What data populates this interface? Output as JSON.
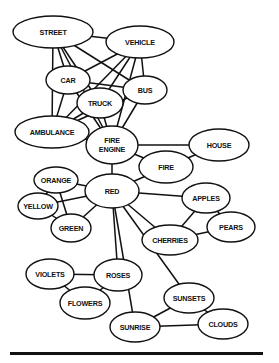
{
  "diagram": {
    "type": "semantic-network",
    "colors": {
      "line": "#111111",
      "node_fill": "#ffffff",
      "background": "#ffffff"
    },
    "nodes": [
      {
        "id": "street",
        "lines": [
          "STREET"
        ],
        "cx": 53,
        "cy": 32,
        "rx": 40,
        "ry": 16
      },
      {
        "id": "vehicle",
        "lines": [
          "VEHICLE"
        ],
        "cx": 140,
        "cy": 42,
        "rx": 34,
        "ry": 16
      },
      {
        "id": "car",
        "lines": [
          "CAR"
        ],
        "cx": 68,
        "cy": 80,
        "rx": 22,
        "ry": 14
      },
      {
        "id": "truck",
        "lines": [
          "TRUCK"
        ],
        "cx": 100,
        "cy": 103,
        "rx": 23,
        "ry": 15
      },
      {
        "id": "bus",
        "lines": [
          "BUS"
        ],
        "cx": 145,
        "cy": 90,
        "rx": 22,
        "ry": 14
      },
      {
        "id": "ambulance",
        "lines": [
          "AMBULANCE"
        ],
        "cx": 52,
        "cy": 132,
        "rx": 37,
        "ry": 16
      },
      {
        "id": "fire-engine",
        "lines": [
          "FIRE",
          "ENGINE"
        ],
        "cx": 112,
        "cy": 145,
        "rx": 26,
        "ry": 19
      },
      {
        "id": "house",
        "lines": [
          "HOUSE"
        ],
        "cx": 219,
        "cy": 145,
        "rx": 30,
        "ry": 16
      },
      {
        "id": "fire",
        "lines": [
          "FIRE"
        ],
        "cx": 166,
        "cy": 167,
        "rx": 27,
        "ry": 16
      },
      {
        "id": "orange",
        "lines": [
          "ORANGE"
        ],
        "cx": 56,
        "cy": 180,
        "rx": 22,
        "ry": 13
      },
      {
        "id": "red",
        "lines": [
          "RED"
        ],
        "cx": 112,
        "cy": 191,
        "rx": 27,
        "ry": 17
      },
      {
        "id": "yellow",
        "lines": [
          "YELLOW"
        ],
        "cx": 38,
        "cy": 206,
        "rx": 20,
        "ry": 13
      },
      {
        "id": "apples",
        "lines": [
          "APPLES"
        ],
        "cx": 206,
        "cy": 198,
        "rx": 24,
        "ry": 15
      },
      {
        "id": "green",
        "lines": [
          "GREEN"
        ],
        "cx": 71,
        "cy": 228,
        "rx": 20,
        "ry": 14
      },
      {
        "id": "pears",
        "lines": [
          "PEARS"
        ],
        "cx": 231,
        "cy": 227,
        "rx": 24,
        "ry": 15
      },
      {
        "id": "cherries",
        "lines": [
          "CHERRIES"
        ],
        "cx": 170,
        "cy": 240,
        "rx": 28,
        "ry": 15
      },
      {
        "id": "violets",
        "lines": [
          "VIOLETS"
        ],
        "cx": 50,
        "cy": 274,
        "rx": 24,
        "ry": 15
      },
      {
        "id": "roses",
        "lines": [
          "ROSES"
        ],
        "cx": 118,
        "cy": 275,
        "rx": 24,
        "ry": 16
      },
      {
        "id": "flowers",
        "lines": [
          "FLOWERS"
        ],
        "cx": 85,
        "cy": 303,
        "rx": 25,
        "ry": 16
      },
      {
        "id": "sunsets",
        "lines": [
          "SUNSETS"
        ],
        "cx": 189,
        "cy": 298,
        "rx": 25,
        "ry": 15
      },
      {
        "id": "sunrise",
        "lines": [
          "SUNRISE"
        ],
        "cx": 135,
        "cy": 327,
        "rx": 25,
        "ry": 15
      },
      {
        "id": "clouds",
        "lines": [
          "CLOUDS"
        ],
        "cx": 223,
        "cy": 324,
        "rx": 25,
        "ry": 15
      }
    ],
    "edges": [
      [
        "street",
        "vehicle"
      ],
      [
        "street",
        "car"
      ],
      [
        "street",
        "truck"
      ],
      [
        "street",
        "bus"
      ],
      [
        "street",
        "ambulance"
      ],
      [
        "street",
        "fire-engine"
      ],
      [
        "vehicle",
        "car"
      ],
      [
        "vehicle",
        "truck"
      ],
      [
        "vehicle",
        "bus"
      ],
      [
        "vehicle",
        "ambulance"
      ],
      [
        "vehicle",
        "fire-engine"
      ],
      [
        "car",
        "bus"
      ],
      [
        "car",
        "ambulance"
      ],
      [
        "car",
        "fire-engine"
      ],
      [
        "truck",
        "ambulance"
      ],
      [
        "truck",
        "fire-engine"
      ],
      [
        "bus",
        "ambulance"
      ],
      [
        "bus",
        "fire-engine"
      ],
      [
        "ambulance",
        "fire-engine"
      ],
      [
        "fire-engine",
        "house"
      ],
      [
        "fire-engine",
        "fire"
      ],
      [
        "fire-engine",
        "red"
      ],
      [
        "house",
        "fire"
      ],
      [
        "fire",
        "red"
      ],
      [
        "red",
        "orange"
      ],
      [
        "red",
        "yellow"
      ],
      [
        "red",
        "green"
      ],
      [
        "orange",
        "yellow"
      ],
      [
        "orange",
        "green"
      ],
      [
        "yellow",
        "green"
      ],
      [
        "red",
        "apples"
      ],
      [
        "red",
        "cherries"
      ],
      [
        "red",
        "roses"
      ],
      [
        "red",
        "sunsets"
      ],
      [
        "red",
        "sunrise"
      ],
      [
        "apples",
        "pears"
      ],
      [
        "apples",
        "cherries"
      ],
      [
        "cherries",
        "pears"
      ],
      [
        "violets",
        "roses"
      ],
      [
        "violets",
        "flowers"
      ],
      [
        "roses",
        "flowers"
      ],
      [
        "sunsets",
        "sunrise"
      ],
      [
        "sunsets",
        "clouds"
      ],
      [
        "sunrise",
        "clouds"
      ]
    ],
    "rule": {
      "x": 10,
      "y": 352,
      "width": 253,
      "height": 3
    }
  }
}
